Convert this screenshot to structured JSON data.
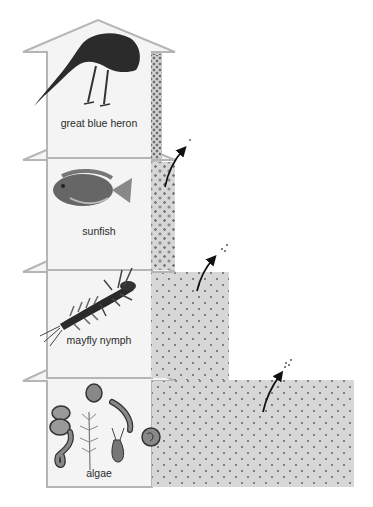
{
  "diagram": {
    "type": "energy pyramid / food chain",
    "levels": [
      {
        "name": "great blue heron",
        "order": 4,
        "icon": "heron-icon"
      },
      {
        "name": "sunfish",
        "order": 3,
        "icon": "fish-icon"
      },
      {
        "name": "mayfly nymph",
        "order": 2,
        "icon": "insect-icon"
      },
      {
        "name": "algae",
        "order": 1,
        "icon": "algae-icon"
      }
    ],
    "energy_bars": [
      {
        "level": "great blue heron",
        "relative_width": 1
      },
      {
        "level": "sunfish",
        "relative_width": 2
      },
      {
        "level": "mayfly nymph",
        "relative_width": 7
      },
      {
        "level": "algae",
        "relative_width": 17
      }
    ],
    "heat_loss_arrows": 3
  },
  "labels": {
    "heron": "great blue heron",
    "sunfish": "sunfish",
    "mayfly": "mayfly nymph",
    "algae": "algae"
  },
  "colors": {
    "arrow_fill": "#f4f4f4",
    "arrow_stroke": "#b5b5b5",
    "bar_fill": "#d7d7d7",
    "bar_dots": "#7f7f7f",
    "loss_arrow": "#111111"
  }
}
